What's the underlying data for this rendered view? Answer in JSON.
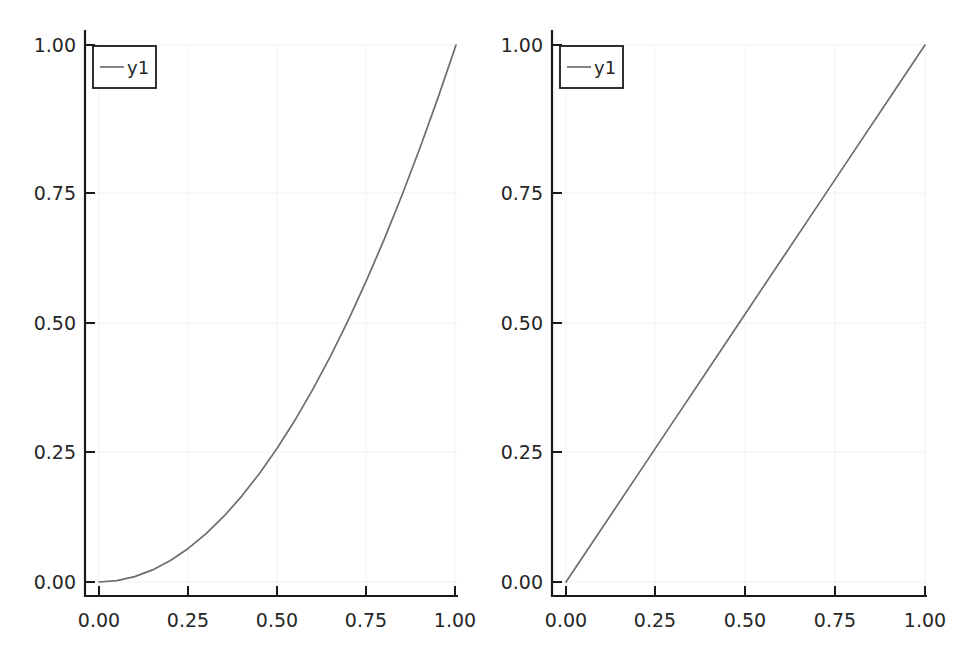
{
  "figure": {
    "background_color": "#ffffff",
    "width": 955,
    "height": 664,
    "panel_count": 2
  },
  "style": {
    "line_color": "#6c6c73",
    "axis_color": "#1a1a1a",
    "grid_color": "#f2f2f4",
    "text_color": "#262626",
    "legend_border_color": "#1a1a1a",
    "legend_background": "#ffffff"
  },
  "chart_data": [
    {
      "type": "line",
      "title": "",
      "subtitle": "",
      "xlabel": "",
      "ylabel": "",
      "xlim": [
        0.0,
        1.0
      ],
      "ylim": [
        0.0,
        1.0
      ],
      "xticks": [
        0.0,
        0.25,
        0.5,
        0.75,
        1.0
      ],
      "yticks": [
        0.0,
        0.25,
        0.5,
        0.75,
        1.0
      ],
      "xticklabels": [
        "0.00",
        "0.25",
        "0.50",
        "0.75",
        "1.00"
      ],
      "yticklabels": [
        "0.00",
        "0.25",
        "0.50",
        "0.75",
        "1.00"
      ],
      "grid": true,
      "legend_position": "upper left",
      "series": [
        {
          "name": "y1",
          "color": "#6c6c73",
          "x": [
            0.0,
            0.05,
            0.1,
            0.15,
            0.2,
            0.25,
            0.3,
            0.35,
            0.4,
            0.45,
            0.5,
            0.55,
            0.6,
            0.65,
            0.7,
            0.75,
            0.8,
            0.85,
            0.9,
            0.95,
            1.0
          ],
          "values": [
            0.0,
            0.0025,
            0.01,
            0.0225,
            0.04,
            0.0625,
            0.09,
            0.1225,
            0.16,
            0.2025,
            0.25,
            0.3025,
            0.36,
            0.4225,
            0.49,
            0.5625,
            0.64,
            0.7225,
            0.81,
            0.9025,
            1.0
          ]
        }
      ]
    },
    {
      "type": "line",
      "title": "",
      "subtitle": "",
      "xlabel": "",
      "ylabel": "",
      "xlim": [
        0.0,
        1.0
      ],
      "ylim": [
        0.0,
        1.0
      ],
      "xticks": [
        0.0,
        0.25,
        0.5,
        0.75,
        1.0
      ],
      "yticks": [
        0.0,
        0.25,
        0.5,
        0.75,
        1.0
      ],
      "xticklabels": [
        "0.00",
        "0.25",
        "0.50",
        "0.75",
        "1.00"
      ],
      "yticklabels": [
        "0.00",
        "0.25",
        "0.50",
        "0.75",
        "1.00"
      ],
      "grid": true,
      "legend_position": "upper left",
      "series": [
        {
          "name": "y1",
          "color": "#6c6c73",
          "x": [
            0.0,
            0.1,
            0.2,
            0.3,
            0.4,
            0.5,
            0.6,
            0.7,
            0.8,
            0.9,
            1.0
          ],
          "values": [
            0.0,
            0.1,
            0.2,
            0.3,
            0.4,
            0.5,
            0.6,
            0.7,
            0.8,
            0.9,
            1.0
          ]
        }
      ]
    }
  ],
  "panels": {
    "left": {
      "y_tick_labels": [
        "1.00",
        "0.75",
        "0.50",
        "0.25",
        "0.00"
      ],
      "x_tick_labels": [
        "0.00",
        "0.25",
        "0.50",
        "0.75",
        "1.00"
      ],
      "legend_entry": "y1"
    },
    "right": {
      "y_tick_labels": [
        "1.00",
        "0.75",
        "0.50",
        "0.25",
        "0.00"
      ],
      "x_tick_labels": [
        "0.00",
        "0.25",
        "0.50",
        "0.75",
        "1.00"
      ],
      "legend_entry": "y1"
    }
  }
}
